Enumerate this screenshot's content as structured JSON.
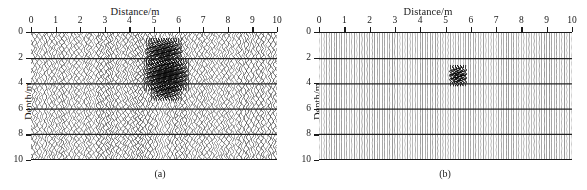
{
  "figure": {
    "axis_titles": {
      "x": "Distance/m",
      "y": "Depth/m"
    },
    "captions": {
      "a": "(a)",
      "b": "(b)"
    },
    "colors": {
      "ink": "#1a1a1a",
      "trace": "#4a4a4a",
      "grid": "#202020",
      "background": "#ffffff"
    }
  },
  "chart_data": [
    {
      "id": "panel-a",
      "type": "heatmap",
      "title": "(a)",
      "xlabel": "Distance/m",
      "ylabel": "Depth/m",
      "xlim": [
        0,
        10
      ],
      "ylim": [
        10,
        0
      ],
      "xticks": [
        0,
        1,
        2,
        3,
        4,
        5,
        6,
        7,
        8,
        9,
        10
      ],
      "yticks": [
        0,
        2,
        4,
        6,
        8,
        10
      ],
      "xtick_labels": [
        "0",
        "1",
        "2",
        "3",
        "4",
        "5",
        "6",
        "7",
        "8",
        "9",
        "10"
      ],
      "ytick_labels": [
        "0",
        "2",
        "4",
        "6",
        "8",
        "10"
      ],
      "grid": true,
      "grid_axis": "y",
      "legend": "none",
      "render_style": "wiggle-trace",
      "n_traces": 101,
      "noise_level": 0.55,
      "annotations": [
        "unmigrated diffraction hyperbola centred near x = 5.5 m"
      ],
      "anomalies": [
        {
          "name": "diffraction-lobe-shallow",
          "x": 5.4,
          "y": 1.5,
          "width": 1.6,
          "height": 1.1,
          "intensity": 0.85
        },
        {
          "name": "diffraction-apex",
          "x": 5.5,
          "y": 3.3,
          "width": 1.9,
          "height": 1.3,
          "intensity": 1.0
        },
        {
          "name": "diffraction-lobe-deep",
          "x": 5.5,
          "y": 4.6,
          "width": 1.3,
          "height": 0.8,
          "intensity": 0.7
        }
      ]
    },
    {
      "id": "panel-b",
      "type": "heatmap",
      "title": "(b)",
      "xlabel": "Distance/m",
      "ylabel": "Depth/m",
      "xlim": [
        0,
        10
      ],
      "ylim": [
        10,
        0
      ],
      "xticks": [
        0,
        1,
        2,
        3,
        4,
        5,
        6,
        7,
        8,
        9,
        10
      ],
      "yticks": [
        0,
        2,
        4,
        6,
        8,
        10
      ],
      "xtick_labels": [
        "0",
        "1",
        "2",
        "3",
        "4",
        "5",
        "6",
        "7",
        "8",
        "9",
        "10"
      ],
      "ytick_labels": [
        "0",
        "2",
        "4",
        "6",
        "8",
        "10"
      ],
      "grid": true,
      "grid_axis": "y",
      "legend": "none",
      "render_style": "wiggle-trace",
      "n_traces": 101,
      "noise_level": 0.1,
      "annotations": [
        "migrated image: energy collapsed to a point scatterer at x = 5.5 m, depth 3.4 m"
      ],
      "anomalies": [
        {
          "name": "focused-point-scatterer",
          "x": 5.5,
          "y": 3.4,
          "width": 0.75,
          "height": 0.85,
          "intensity": 1.0
        }
      ]
    }
  ]
}
